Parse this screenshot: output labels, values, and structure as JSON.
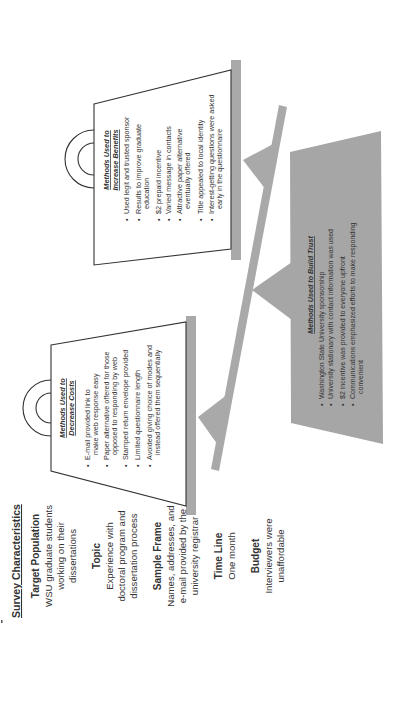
{
  "diagram": {
    "orientation": "rotated-90-ccw",
    "colors": {
      "background": "#ffffff",
      "bar_gray": "#a9a9a9",
      "trust_box_gray": "#a6a6a6",
      "outline": "#333333",
      "text": "#333333"
    },
    "survey_characteristics": {
      "title": "Survey Characteristics",
      "sections": [
        {
          "heading": "Target Population",
          "lines": [
            "WSU graduate students",
            "working on their",
            "dissertations"
          ]
        },
        {
          "heading": "Topic",
          "lines": [
            "Experience with",
            "doctoral program and",
            "dissertation process"
          ]
        },
        {
          "heading": "Sample Frame",
          "lines": [
            "Names, addresses, and",
            "e-mail provided by the",
            "university registrar"
          ]
        },
        {
          "heading": "Time Line",
          "lines": [
            "One month"
          ]
        },
        {
          "heading": "Budget",
          "lines": [
            "Interviewers were",
            "unaffordable"
          ]
        }
      ]
    },
    "decrease_costs": {
      "title_line1": "Methods Used to",
      "title_line2": "Decrease Costs",
      "items": [
        {
          "lines": [
            "E-mail provided link to",
            "make web response easy"
          ]
        },
        {
          "lines": [
            "Paper alternative offered for those",
            "opposed to responding by web"
          ]
        },
        {
          "lines": [
            "Stamped return envelope provided"
          ]
        },
        {
          "lines": [
            "Limited questionnaire length"
          ]
        },
        {
          "lines": [
            "Avoided giving choice of modes and",
            "instead offered them sequentially"
          ]
        }
      ]
    },
    "increase_benefits": {
      "title_line1": "Methods Used to",
      "title_line2": "Increase Benefits",
      "items": [
        {
          "lines": [
            "Used legit and trusted sponsor"
          ]
        },
        {
          "lines": [
            "Results to improve graduate",
            "education"
          ]
        },
        {
          "lines": [
            "$2 prepaid incentive"
          ]
        },
        {
          "lines": [
            "Varied message in contacts"
          ]
        },
        {
          "lines": [
            "Attractive paper alternative",
            "eventually offered"
          ]
        },
        {
          "lines": [
            "Title appealed to local identity"
          ]
        },
        {
          "lines": [
            "Interest-getting questions were asked",
            "early in the questionnaire"
          ]
        }
      ]
    },
    "build_trust": {
      "title": "Methods Used to Build Trust",
      "items": [
        {
          "lines": [
            "Washington State University sponsorship"
          ]
        },
        {
          "lines": [
            "University stationary with contact information was used"
          ]
        },
        {
          "lines": [
            "$2 incentive was provided to everyone upfront"
          ]
        },
        {
          "lines": [
            "Communications emphasized efforts to make responding",
            "convenient"
          ]
        }
      ]
    },
    "bullet_glyph": "•"
  }
}
